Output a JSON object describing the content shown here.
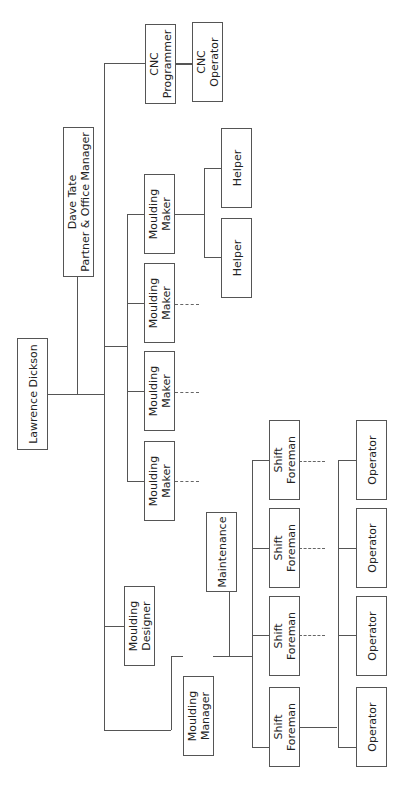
{
  "chart": {
    "type": "org-chart",
    "orientation": "rotated -90deg",
    "nodes": {
      "ceo": {
        "label": "Lawrence Dickson"
      },
      "partner": {
        "label": "Dave Tate\nPartner & Office Manager"
      },
      "cnc_programmer": {
        "label": "CNC\nProgrammer"
      },
      "cnc_operator": {
        "label": "CNC\nOperator"
      },
      "moulding_makers": [
        {
          "label": "Moulding\nMaker"
        },
        {
          "label": "Moulding\nMaker"
        },
        {
          "label": "Moulding\nMaker"
        },
        {
          "label": "Moulding\nMaker"
        }
      ],
      "helpers": [
        {
          "label": "Helper"
        },
        {
          "label": "Helper"
        }
      ],
      "moulding_designer": {
        "label": "Moulding\nDesigner"
      },
      "moulding_manager": {
        "label": "Moulding\nManager"
      },
      "maintenance": {
        "label": "Maintenance"
      },
      "shift_foremen": [
        {
          "label": "Shift\nForeman"
        },
        {
          "label": "Shift\nForeman"
        },
        {
          "label": "Shift\nForeman"
        },
        {
          "label": "Shift\nForeman"
        }
      ],
      "operators": [
        {
          "label": "Operator"
        },
        {
          "label": "Operator"
        },
        {
          "label": "Operator"
        },
        {
          "label": "Operator"
        }
      ]
    }
  }
}
